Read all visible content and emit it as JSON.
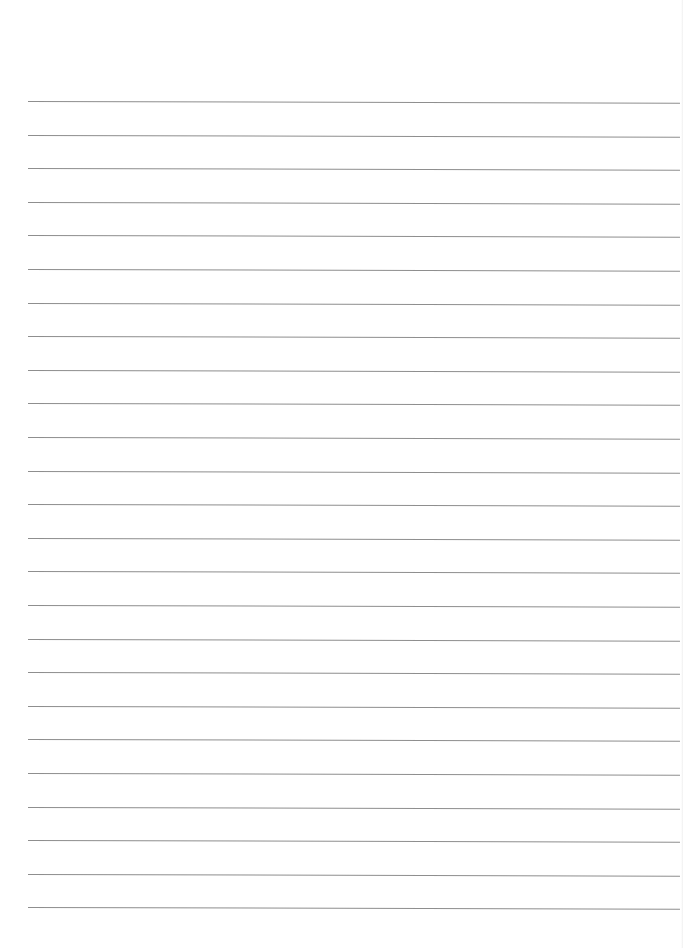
{
  "page": {
    "type": "lined-paper",
    "background_color": "#ffffff",
    "rule_color": "#8e8e8e",
    "rule_count": 25,
    "text": ""
  }
}
